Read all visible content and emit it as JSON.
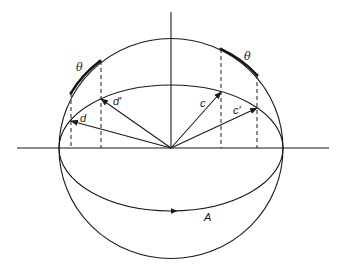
{
  "diagram": {
    "type": "sphere-rotation",
    "center": [
      171,
      148
    ],
    "sphere_radius": 111,
    "equator_ellipse": {
      "rx": 112,
      "ry": 63
    },
    "axes": {
      "horizontal": {
        "x1": 17,
        "x2": 329,
        "y": 148
      },
      "vertical": {
        "x": 171,
        "y1": 12,
        "y2": 148
      }
    },
    "vectors": [
      {
        "id": "d",
        "label": "d",
        "tip": [
          71,
          121
        ],
        "label_pos": [
          80,
          122
        ]
      },
      {
        "id": "d-prime",
        "label": "d′",
        "tip": [
          101,
          99
        ],
        "label_pos": [
          113,
          105
        ]
      },
      {
        "id": "c",
        "label": "c",
        "tip": [
          221,
          92
        ],
        "label_pos": [
          200,
          107
        ]
      },
      {
        "id": "c-prime",
        "label": "c′",
        "tip": [
          257,
          108
        ],
        "label_pos": [
          233,
          114
        ]
      }
    ],
    "theta_arcs": [
      {
        "label": "θ",
        "from": [
          71,
          93
        ],
        "to": [
          100,
          61
        ],
        "label_pos": [
          76,
          71
        ]
      },
      {
        "label": "θ",
        "from": [
          221,
          49
        ],
        "to": [
          257,
          75
        ],
        "label_pos": [
          244,
          60
        ]
      }
    ],
    "dashed_lines": [
      {
        "x": 71,
        "y1": 93,
        "y2": 148
      },
      {
        "x": 101,
        "y1": 61,
        "y2": 148
      },
      {
        "x": 221,
        "y1": 49,
        "y2": 148
      },
      {
        "x": 257,
        "y1": 75,
        "y2": 148
      }
    ],
    "rotation_arrow": {
      "label": "A",
      "arrow_pos": [
        177,
        211
      ],
      "label_pos": [
        204,
        221
      ]
    }
  }
}
